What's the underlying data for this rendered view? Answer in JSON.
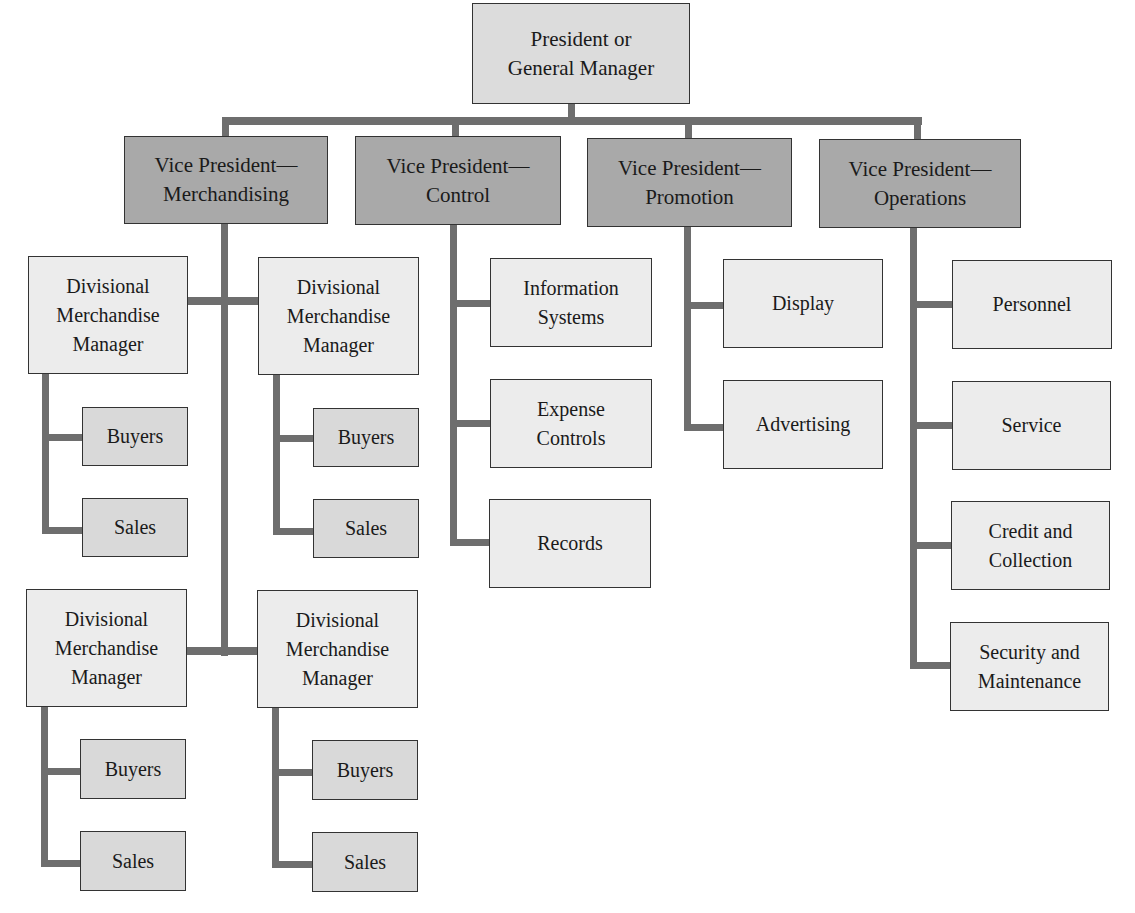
{
  "chart": {
    "type": "organization-chart",
    "root": {
      "label": "President or\nGeneral Manager",
      "children": [
        {
          "label": "Vice President—\nMerchandising",
          "divisions": [
            {
              "label": "Divisional\nMerchandise\nManager",
              "children": [
                "Buyers",
                "Sales"
              ]
            },
            {
              "label": "Divisional\nMerchandise\nManager",
              "children": [
                "Buyers",
                "Sales"
              ]
            },
            {
              "label": "Divisional\nMerchandise\nManager",
              "children": [
                "Buyers",
                "Sales"
              ]
            },
            {
              "label": "Divisional\nMerchandise\nManager",
              "children": [
                "Buyers",
                "Sales"
              ]
            }
          ]
        },
        {
          "label": "Vice President—\nControl",
          "children": [
            "Information\nSystems",
            "Expense\nControls",
            "Records"
          ]
        },
        {
          "label": "Vice President—\nPromotion",
          "children": [
            "Display",
            "Advertising"
          ]
        },
        {
          "label": "Vice President—\nOperations",
          "children": [
            "Personnel",
            "Service",
            "Credit and\nCollection",
            "Security and\nMaintenance"
          ]
        }
      ]
    }
  },
  "colors": {
    "connector": "#6e6e6e",
    "president_fill": "#dcdcdc",
    "vp_fill": "#a9a9a9",
    "department_fill": "#ececec",
    "buyers_sales_fill": "#d9d9d9",
    "border": "#333333"
  }
}
